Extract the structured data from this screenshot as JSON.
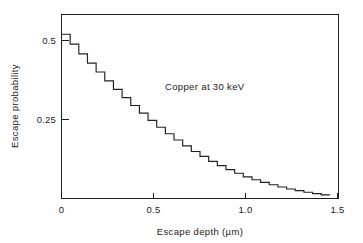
{
  "chart_data": {
    "type": "line",
    "subtype": "step",
    "title": "",
    "annotation": "Copper at 30 keV",
    "xlabel": "Escape depth   (µm)",
    "ylabel": "Escape probability",
    "xlim": [
      0,
      1.6
    ],
    "ylim": [
      0,
      0.56
    ],
    "grid": false,
    "legend": null,
    "xticks": [
      0,
      0.5,
      1.0,
      1.5
    ],
    "xtick_labels": [
      "0",
      "0.5",
      "1.0",
      "1.5"
    ],
    "yticks": [
      0.25,
      0.5
    ],
    "ytick_labels": [
      "0.25",
      "0.5"
    ],
    "step_width": 0.05,
    "x": [
      0.0,
      0.05,
      0.1,
      0.15,
      0.2,
      0.25,
      0.3,
      0.35,
      0.4,
      0.45,
      0.5,
      0.55,
      0.6,
      0.65,
      0.7,
      0.75,
      0.8,
      0.85,
      0.9,
      0.95,
      1.0,
      1.05,
      1.1,
      1.15,
      1.2,
      1.25,
      1.3,
      1.35,
      1.4,
      1.45,
      1.5
    ],
    "values": [
      0.5,
      0.47,
      0.44,
      0.412,
      0.385,
      0.358,
      0.332,
      0.307,
      0.283,
      0.26,
      0.238,
      0.217,
      0.197,
      0.178,
      0.16,
      0.143,
      0.128,
      0.113,
      0.1,
      0.088,
      0.077,
      0.066,
      0.057,
      0.049,
      0.042,
      0.035,
      0.029,
      0.024,
      0.019,
      0.015,
      0.011
    ]
  },
  "figure": {
    "annotation_label": "Copper at 30 keV",
    "x_axis_title": "Escape depth   (µm)",
    "y_axis_title": "Escape probability",
    "xtick_0": "0",
    "xtick_1": "0.5",
    "xtick_2": "1.0",
    "xtick_3": "1.5",
    "ytick_0": "0.25",
    "ytick_1": "0.5"
  },
  "colors": {
    "curve": "#202020",
    "axis": "#1f1f1f",
    "background": "#ffffff",
    "text": "#1a1a1a"
  }
}
